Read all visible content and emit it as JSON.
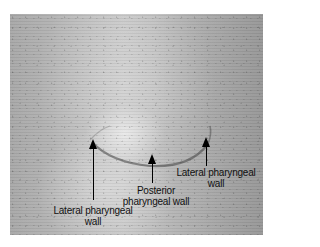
{
  "figure": {
    "labels": {
      "lateral_left": [
        "Lateral pharyngeal",
        "wall"
      ],
      "posterior": [
        "Posterior",
        "pharyngeal wall"
      ],
      "lateral_right": [
        "Lateral pharyngeal",
        "wall"
      ]
    },
    "arrows": [
      {
        "name": "lateral-left",
        "tip_x": 93,
        "tip_y": 139,
        "tail_y": 200
      },
      {
        "name": "posterior",
        "tip_x": 152,
        "tip_y": 154,
        "tail_y": 183
      },
      {
        "name": "lateral-right",
        "tip_x": 206,
        "tip_y": 137,
        "tail_y": 166
      }
    ],
    "colors": {
      "background": "#ffffff",
      "photo_tone": "#b8b8b8",
      "ink": "#000000"
    }
  }
}
